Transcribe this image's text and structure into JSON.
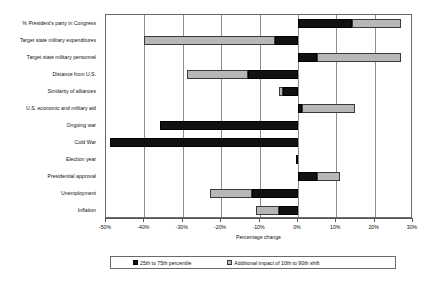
{
  "chart_data": {
    "type": "bar",
    "orientation": "horizontal",
    "title": "",
    "xlabel": "Percentage change",
    "ylabel": "",
    "xlim": [
      -50,
      30
    ],
    "xtick_labels": [
      "-50%",
      "-40%",
      "-30%",
      "-20%",
      "-10%",
      "0%",
      "10%",
      "20%",
      "30%"
    ],
    "xticks": [
      -50,
      -40,
      -30,
      -20,
      -10,
      0,
      10,
      20,
      30
    ],
    "grid": "vertical",
    "legend_position": "bottom",
    "legend": [
      {
        "label": "25th to 75th percentile",
        "swatch": "black"
      },
      {
        "label": "Additional impact of 10th to 90th shift",
        "swatch": "gray"
      }
    ],
    "categories": [
      "% President's party in Congress",
      "Target state military expenditures",
      "Target state military personnel",
      "Distance from U.S.",
      "Similarity of alliances",
      "U.S. economic and military aid",
      "Ongoing war",
      "Cold War",
      "Election year",
      "Presidential approval",
      "Unemployment",
      "Inflation"
    ],
    "bars": [
      {
        "category": "% President's party in Congress",
        "inner_start": 0,
        "inner_end": 14,
        "outer_start": 14,
        "outer_end": 27
      },
      {
        "category": "Target state military expenditures",
        "inner_start": -6,
        "inner_end": 0,
        "outer_start": -40,
        "outer_end": -6
      },
      {
        "category": "Target state military personnel",
        "inner_start": 0,
        "inner_end": 5,
        "outer_start": 5,
        "outer_end": 27
      },
      {
        "category": "Distance from U.S.",
        "inner_start": -13,
        "inner_end": 0,
        "outer_start": -29,
        "outer_end": -13
      },
      {
        "category": "Similarity of alliances",
        "inner_start": -4,
        "inner_end": 0,
        "outer_start": -5,
        "outer_end": -4
      },
      {
        "category": "U.S. economic and military aid",
        "inner_start": 0,
        "inner_end": 1,
        "outer_start": 1,
        "outer_end": 15
      },
      {
        "category": "Ongoing war",
        "inner_start": -36,
        "inner_end": 0,
        "outer_start": 0,
        "outer_end": 0
      },
      {
        "category": "Cold War",
        "inner_start": -49,
        "inner_end": 0,
        "outer_start": 0,
        "outer_end": 0
      },
      {
        "category": "Election year",
        "inner_start": -0.6,
        "inner_end": 0,
        "outer_start": 0,
        "outer_end": 0
      },
      {
        "category": "Presidential approval",
        "inner_start": 0,
        "inner_end": 5,
        "outer_start": 5,
        "outer_end": 11
      },
      {
        "category": "Unemployment",
        "inner_start": -12,
        "inner_end": 0,
        "outer_start": -23,
        "outer_end": -12
      },
      {
        "category": "Inflation",
        "inner_start": -5,
        "inner_end": 0,
        "outer_start": -11,
        "outer_end": -5
      }
    ],
    "series": [
      {
        "name": "25th to 75th percentile",
        "color": "#111111",
        "values": [
          14,
          -6,
          5,
          -13,
          -4,
          1,
          -36,
          -49,
          -0.6,
          5,
          -12,
          -5
        ]
      },
      {
        "name": "Additional impact of 10th to 90th shift",
        "color": "#b7b7b7",
        "values": [
          27,
          -40,
          27,
          -29,
          -5,
          15,
          0,
          0,
          0,
          11,
          -23,
          -11
        ]
      }
    ]
  }
}
